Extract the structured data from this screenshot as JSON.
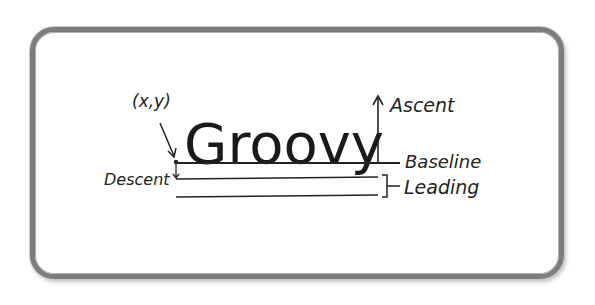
{
  "diagram": {
    "word": "Groovy",
    "labels": {
      "origin": "(x,y)",
      "ascent": "Ascent",
      "baseline": "Baseline",
      "descent": "Descent",
      "leading": "Leading"
    }
  },
  "colors": {
    "frame": "#7d7d7d",
    "ink": "#222222",
    "background": "#ffffff"
  }
}
